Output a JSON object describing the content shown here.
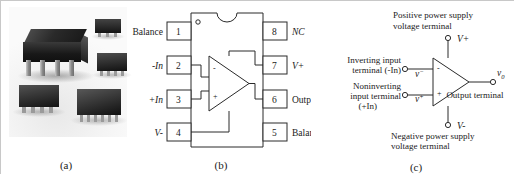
{
  "figure": {
    "panels": [
      {
        "id": "a",
        "caption": "(a)",
        "description": "photograph of operational amplifier IC packages"
      },
      {
        "id": "b",
        "caption": "(b)",
        "description": "8-pin DIP pin assignment diagram"
      },
      {
        "id": "c",
        "caption": "(c)",
        "description": "op-amp schematic symbol with terminal names"
      }
    ]
  },
  "panel_a": {
    "caption": "(a)",
    "packages": [
      {
        "name": "dip-8-package"
      },
      {
        "name": "sot-package"
      },
      {
        "name": "soic-package-right"
      },
      {
        "name": "soic-8-package-left"
      },
      {
        "name": "tssop-package"
      }
    ]
  },
  "panel_b": {
    "caption": "(b)",
    "pin1_marker": "○",
    "pins_left": [
      {
        "number": "1",
        "label": "Balance",
        "italic": false
      },
      {
        "number": "2",
        "label": "-In",
        "italic": true
      },
      {
        "number": "3",
        "label": "+In",
        "italic": true
      },
      {
        "number": "4",
        "label": "V-",
        "italic": true
      }
    ],
    "pins_right": [
      {
        "number": "8",
        "label": "NC",
        "italic": true
      },
      {
        "number": "7",
        "label": "V+",
        "italic": true
      },
      {
        "number": "6",
        "label": "Output",
        "italic": false
      },
      {
        "number": "5",
        "label": "Balance",
        "italic": false
      }
    ],
    "amp_inverting_sign": "-",
    "amp_noninverting_sign": "+"
  },
  "panel_c": {
    "caption": "(c)",
    "top_label_line1": "Positive power supply",
    "top_label_line2": "voltage terminal",
    "bottom_label_line1": "Negative power supply",
    "bottom_label_line2": "voltage terminal",
    "inverting_label_line1": "Inverting input",
    "inverting_label_line2": "terminal (-In)",
    "noninverting_label_line1": "Noninverting",
    "noninverting_label_line2": "input terminal",
    "noninverting_label_line3": "(+In)",
    "output_label": "Output terminal",
    "v_plus_supply": "V+",
    "v_minus_supply": "V-",
    "v_minus_input": "v",
    "v_minus_input_sup": "−",
    "v_plus_input": "v",
    "v_plus_input_sup": "+",
    "output_symbol": "v",
    "output_symbol_sub": "0",
    "amp_inverting_sign": "-",
    "amp_noninverting_sign": "+"
  },
  "colors": {
    "line": "#2a2a2a",
    "text": "#1a1a1a",
    "background": "#ffffff",
    "border": "#c8c8c8"
  }
}
